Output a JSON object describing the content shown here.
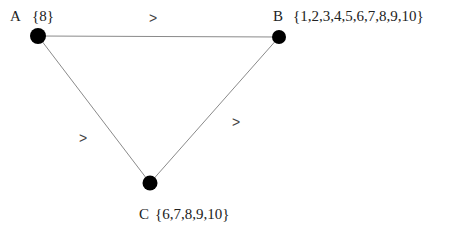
{
  "diagram": {
    "nodes": [
      {
        "id": "A",
        "label": "A",
        "set": "{8}",
        "x": 38,
        "y": 36
      },
      {
        "id": "B",
        "label": "B",
        "set": "{1,2,3,4,5,6,7,8,9,10}",
        "x": 279,
        "y": 37
      },
      {
        "id": "C",
        "label": "C",
        "set": "{6,7,8,9,10}",
        "x": 150,
        "y": 183
      }
    ],
    "edges": [
      {
        "from": "A",
        "to": "B",
        "relation": ">"
      },
      {
        "from": "A",
        "to": "C",
        "relation": ">"
      },
      {
        "from": "B",
        "to": "C",
        "relation": ">"
      }
    ],
    "colors": {
      "node": "#000000",
      "edge": "#888888",
      "text": "#222222"
    }
  }
}
